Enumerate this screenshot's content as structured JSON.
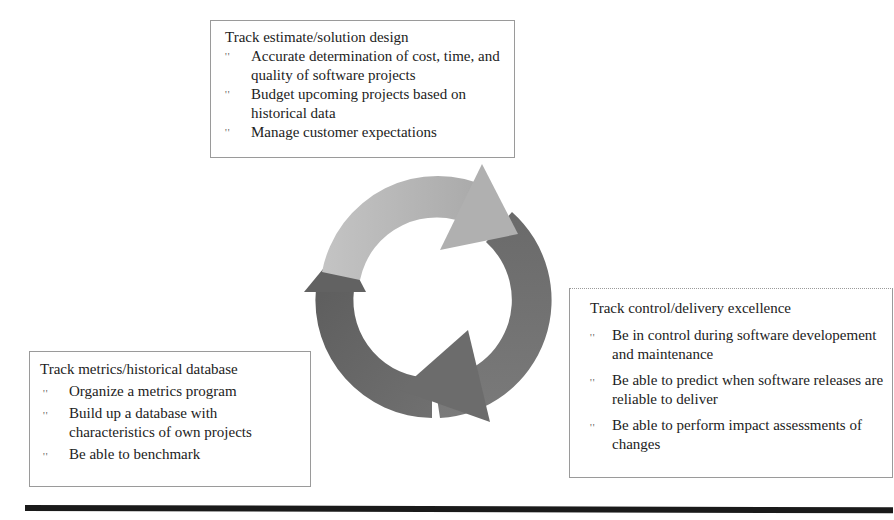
{
  "diagram": {
    "type": "cycle",
    "colors": {
      "arrow_light": "#b2b2b2",
      "arrow_mid": "#707070",
      "arrow_dark": "#666666",
      "border": "#9a9a9a",
      "rule": "#1a1a1a"
    },
    "bullet_glyph": "''",
    "top_box": {
      "title": "Track estimate/solution design",
      "items": [
        "Accurate determination of cost, time, and quality of software projects",
        "Budget upcoming projects based on historical data",
        "Manage customer expectations"
      ]
    },
    "right_box": {
      "title": "Track control/delivery excellence",
      "items": [
        "Be in control during software developement and maintenance",
        "Be able to predict when software releases are reliable to deliver",
        "Be able to perform impact assessments of changes"
      ]
    },
    "left_box": {
      "title": "Track metrics/historical database",
      "items": [
        "Organize a metrics program",
        "Build up a database with characteristics of own projects",
        "Be able to benchmark"
      ]
    }
  }
}
